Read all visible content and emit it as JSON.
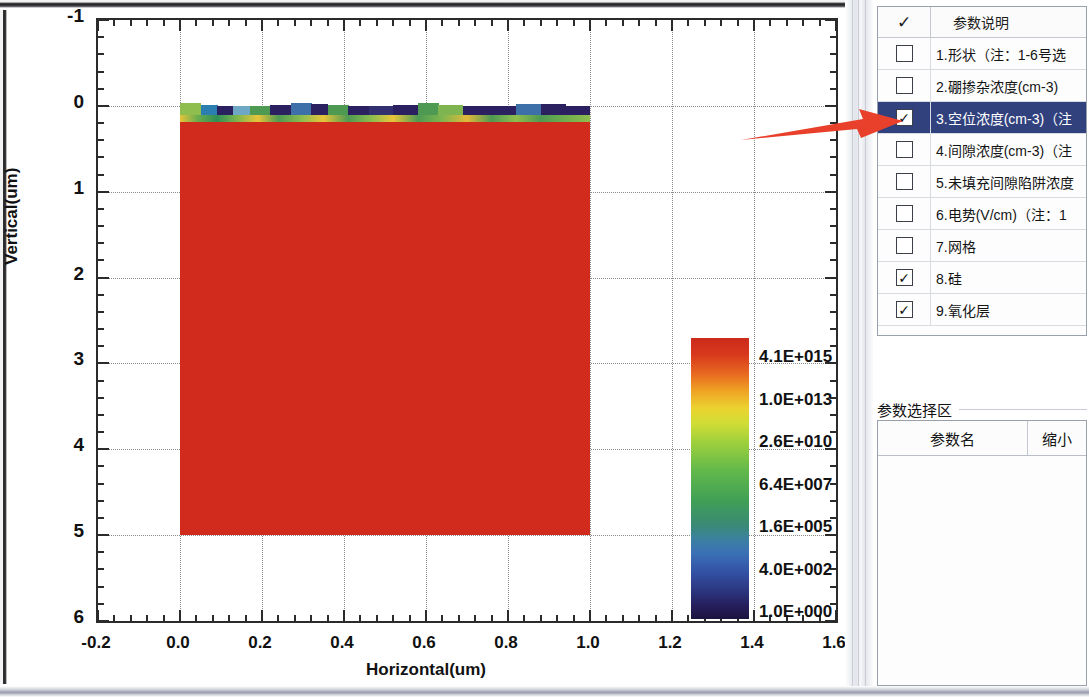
{
  "chart_data": {
    "type": "heatmap",
    "title": "",
    "xlabel": "Horizontal(um)",
    "ylabel": "Vertical(um)",
    "xlim": [
      -0.2,
      1.6
    ],
    "ylim": [
      -1,
      6
    ],
    "y_inverted": true,
    "xticks": [
      "-0.2",
      "0.0",
      "0.2",
      "0.4",
      "0.6",
      "0.8",
      "1.0",
      "1.2",
      "1.4",
      "1.6"
    ],
    "xtick_values": [
      -0.2,
      0.0,
      0.2,
      0.4,
      0.6,
      0.8,
      1.0,
      1.2,
      1.4,
      1.6
    ],
    "yticks": [
      "-1",
      "0",
      "1",
      "2",
      "3",
      "4",
      "5",
      "6"
    ],
    "ytick_values": [
      -1,
      0,
      1,
      2,
      3,
      4,
      5,
      6
    ],
    "grid": true,
    "minor_ticks_per_interval": 5,
    "colorbar": {
      "labels": [
        "4.1E+015",
        "1.0E+013",
        "2.6E+010",
        "6.4E+007",
        "1.6E+005",
        "4.0E+002",
        "1.0E+000"
      ],
      "values": [
        4100000000000000.0,
        10000000000000.0,
        26000000000.0,
        64000000.0,
        160000.0,
        400.0,
        1.0
      ],
      "scale": "log",
      "position": "inside-right",
      "ramp": [
        "#cc2a1c",
        "#e86b20",
        "#ebd330",
        "#63b94a",
        "#3c7fa3",
        "#2c3a85",
        "#1d1340"
      ],
      "unit_note": "cm-3"
    },
    "region": {
      "x_range": [
        0.0,
        1.0
      ],
      "y_range": [
        -0.05,
        5.0
      ],
      "bulk_color": "#d12b1e",
      "bulk_value": 4100000000000000.0,
      "surface_layer_note": "thin mixed-value layer at y~0 with navy/green/yellow patches"
    },
    "surface_segments": [
      {
        "x0": 0.0,
        "x1": 0.05,
        "color": "#8fbe4e"
      },
      {
        "x0": 0.05,
        "x1": 0.09,
        "color": "#2b7fb0"
      },
      {
        "x0": 0.09,
        "x1": 0.13,
        "color": "#2b2060"
      },
      {
        "x0": 0.13,
        "x1": 0.17,
        "color": "#6fa8c4"
      },
      {
        "x0": 0.17,
        "x1": 0.22,
        "color": "#4e9a52"
      },
      {
        "x0": 0.22,
        "x1": 0.27,
        "color": "#2b2060"
      },
      {
        "x0": 0.27,
        "x1": 0.32,
        "color": "#3d6fa8"
      },
      {
        "x0": 0.32,
        "x1": 0.36,
        "color": "#2b2060"
      },
      {
        "x0": 0.36,
        "x1": 0.41,
        "color": "#4e9a52"
      },
      {
        "x0": 0.41,
        "x1": 0.46,
        "color": "#2b2060"
      },
      {
        "x0": 0.46,
        "x1": 0.52,
        "color": "#33306f"
      },
      {
        "x0": 0.52,
        "x1": 0.58,
        "color": "#2b2060"
      },
      {
        "x0": 0.58,
        "x1": 0.63,
        "color": "#4e9a52"
      },
      {
        "x0": 0.63,
        "x1": 0.69,
        "color": "#7fb550"
      },
      {
        "x0": 0.69,
        "x1": 0.75,
        "color": "#2b2060"
      },
      {
        "x0": 0.75,
        "x1": 0.82,
        "color": "#2b2060"
      },
      {
        "x0": 0.82,
        "x1": 0.88,
        "color": "#3d6fa8"
      },
      {
        "x0": 0.88,
        "x1": 0.94,
        "color": "#2b2060"
      },
      {
        "x0": 0.94,
        "x1": 1.0,
        "color": "#2b2060"
      }
    ]
  },
  "params_panel": {
    "header": {
      "check_column": "✓",
      "desc_column": "参数说明"
    },
    "rows": [
      {
        "checked": false,
        "label": "1.形状（注：1-6号选",
        "selected": false
      },
      {
        "checked": false,
        "label": "2.硼掺杂浓度(cm-3)",
        "selected": false
      },
      {
        "checked": true,
        "label": "3.空位浓度(cm-3)（注",
        "selected": true
      },
      {
        "checked": false,
        "label": "4.间隙浓度(cm-3)（注",
        "selected": false
      },
      {
        "checked": false,
        "label": "5.未填充间隙陷阱浓度",
        "selected": false
      },
      {
        "checked": false,
        "label": "6.电势(V/cm)（注：1",
        "selected": false
      },
      {
        "checked": false,
        "label": "7.网格",
        "selected": false
      },
      {
        "checked": true,
        "label": "8.硅",
        "selected": false
      },
      {
        "checked": true,
        "label": "9.氧化层",
        "selected": false
      }
    ],
    "checked_glyph": "✓"
  },
  "selection_panel": {
    "group_title": "参数选择区",
    "columns": [
      "参数名",
      "缩小"
    ],
    "rows": []
  },
  "annotation": {
    "arrow_color": "#e8402a",
    "arrow_points_to": "3.空位浓度(cm-3)"
  },
  "colors": {
    "selection_blue": "#31417e",
    "accent_red": "#d12b1e",
    "arrow_red": "#e8402a"
  }
}
